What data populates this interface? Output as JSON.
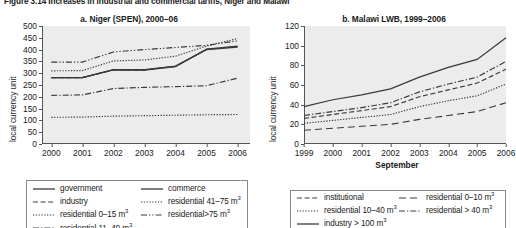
{
  "figure_title": "Figure 3.14  Increases in industrial and commercial tariffs, Niger and Malawi",
  "chart_data": [
    {
      "type": "line",
      "panel": "a",
      "title": "a. Niger (SPEN), 2000–06",
      "xlabel": "",
      "ylabel": "local currency unit",
      "x": [
        2000,
        2001,
        2002,
        2003,
        2004,
        2005,
        2006
      ],
      "xticks": [
        "2000",
        "2001",
        "2002",
        "2003",
        "2004",
        "2005",
        "2006"
      ],
      "xlim": [
        1999.7,
        2006.4
      ],
      "ylim": [
        0,
        500
      ],
      "yticks": [
        0,
        50,
        100,
        150,
        200,
        250,
        300,
        350,
        400,
        450,
        500
      ],
      "grid": false,
      "legend_position": "below",
      "series": [
        {
          "name": "government",
          "style": "solid",
          "values": [
            281,
            281,
            315,
            315,
            330,
            400,
            410
          ]
        },
        {
          "name": "commerce",
          "style": "solid",
          "values": [
            281,
            281,
            314,
            313,
            328,
            402,
            415
          ]
        },
        {
          "name": "industry",
          "style": "dashed",
          "values": [
            281,
            281,
            314,
            313,
            329,
            401,
            413
          ]
        },
        {
          "name": "residential 41–75 m³",
          "style": "dotted",
          "values": [
            310,
            311,
            352,
            356,
            372,
            415,
            447
          ]
        },
        {
          "name": "residential 0–15 m³",
          "style": "dotted",
          "values": [
            113,
            114,
            118,
            120,
            122,
            124,
            125
          ]
        },
        {
          "name": "residential>75 m³",
          "style": "dashdotdot",
          "values": [
            347,
            347,
            390,
            400,
            409,
            418,
            437
          ]
        },
        {
          "name": "residential 11–40 m³",
          "style": "dashdot",
          "values": [
            206,
            208,
            235,
            240,
            243,
            247,
            279
          ]
        }
      ],
      "legend": [
        {
          "label": "government",
          "style": "solid",
          "col": 0,
          "row": 0
        },
        {
          "label": "commerce",
          "style": "solid",
          "col": 1,
          "row": 0
        },
        {
          "label": "industry",
          "style": "dashed",
          "col": 0,
          "row": 1
        },
        {
          "label": "residential 41–75 m",
          "sup": "3",
          "style": "dotted",
          "col": 1,
          "row": 1
        },
        {
          "label": "residential 0–15 m",
          "sup": "3",
          "style": "dotted",
          "col": 0,
          "row": 2
        },
        {
          "label": "residential>75 m",
          "sup": "3",
          "style": "dashdotdot",
          "col": 1,
          "row": 2
        },
        {
          "label": "residential 11–40 m",
          "sup": "3",
          "style": "dashdot",
          "col": 0,
          "row": 3
        }
      ]
    },
    {
      "type": "line",
      "panel": "b",
      "title": "b. Malawi LWB, 1999–2006",
      "xlabel": "September",
      "ylabel": "local currency unit",
      "x": [
        1999,
        2000,
        2001,
        2002,
        2003,
        2004,
        2005,
        2006
      ],
      "xticks": [
        "1999",
        "2000",
        "2001",
        "2002",
        "2003",
        "2004",
        "2005",
        "2006"
      ],
      "xlim": [
        1999,
        2006
      ],
      "ylim": [
        0,
        120
      ],
      "yticks": [
        0,
        20,
        40,
        60,
        80,
        100,
        120
      ],
      "grid": false,
      "legend_position": "below",
      "series": [
        {
          "name": "industry > 100 m³",
          "style": "solid",
          "values": [
            38,
            45,
            50,
            56,
            68,
            78,
            86,
            108
          ]
        },
        {
          "name": "institutional",
          "style": "dashed",
          "values": [
            26,
            30,
            34,
            38,
            48,
            55,
            62,
            76
          ]
        },
        {
          "name": "residential > 40 m³",
          "style": "dashdot",
          "values": [
            29,
            33,
            37,
            42,
            53,
            61,
            68,
            84
          ]
        },
        {
          "name": "residential 10–40 m³",
          "style": "dotted",
          "values": [
            21,
            24,
            27,
            30,
            38,
            44,
            49,
            61
          ]
        },
        {
          "name": "residential 0–10 m³",
          "style": "dashed-long",
          "values": [
            14,
            16,
            18,
            20,
            25,
            29,
            33,
            42
          ]
        }
      ],
      "legend": [
        {
          "label": "institutional",
          "style": "dashed",
          "col": 0,
          "row": 0
        },
        {
          "label": "residential 0–10 m",
          "sup": "3",
          "style": "dashed-long",
          "col": 1,
          "row": 0
        },
        {
          "label": "residential 10–40 m",
          "sup": "3",
          "style": "dotted",
          "col": 0,
          "row": 1
        },
        {
          "label": "residential > 40 m",
          "sup": "3",
          "style": "dashdot",
          "col": 1,
          "row": 1
        },
        {
          "label": "industry > 100 m",
          "sup": "3",
          "style": "solid",
          "col": 0,
          "row": 2
        }
      ]
    }
  ]
}
